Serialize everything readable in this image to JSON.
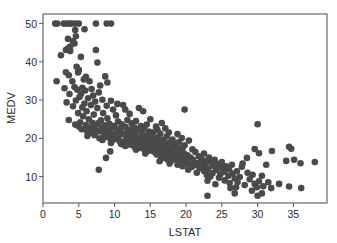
{
  "chart_data": {
    "type": "scatter",
    "title": "",
    "xlabel": "LSTAT",
    "ylabel": "MEDV",
    "xlim": [
      0,
      39.7
    ],
    "ylim": [
      3.1,
      52.5
    ],
    "xticks": [
      0,
      5,
      10,
      15,
      20,
      25,
      30,
      35
    ],
    "yticks": [
      10,
      20,
      30,
      40,
      50
    ],
    "grid": false,
    "legend": null,
    "marker_color": "#4a4a4a",
    "series": [
      {
        "name": "MEDV vs LSTAT",
        "points": [
          [
            1.7,
            50
          ],
          [
            2.0,
            50
          ],
          [
            2.9,
            50
          ],
          [
            3.3,
            50
          ],
          [
            3.7,
            50
          ],
          [
            4.0,
            50
          ],
          [
            4.5,
            50
          ],
          [
            5.0,
            50
          ],
          [
            7.4,
            50
          ],
          [
            8.9,
            50
          ],
          [
            9.5,
            50
          ],
          [
            5.8,
            48.5
          ],
          [
            4.5,
            48.3
          ],
          [
            4.6,
            46.7
          ],
          [
            3.5,
            46
          ],
          [
            4.2,
            45.4
          ],
          [
            4.4,
            44.8
          ],
          [
            3.8,
            44
          ],
          [
            3.5,
            43.5
          ],
          [
            3.2,
            43.1
          ],
          [
            7.4,
            43.1
          ],
          [
            3.8,
            42.8
          ],
          [
            2.5,
            41.7
          ],
          [
            5.3,
            41.3
          ],
          [
            7.6,
            39.8
          ],
          [
            4.7,
            38.7
          ],
          [
            5.0,
            37.9
          ],
          [
            4.9,
            37.2
          ],
          [
            3.2,
            37.3
          ],
          [
            3.6,
            36.5
          ],
          [
            8.7,
            36.2
          ],
          [
            6.0,
            36.1
          ],
          [
            5.7,
            35.4
          ],
          [
            1.9,
            34.9
          ],
          [
            4.1,
            34.9
          ],
          [
            9.0,
            34.6
          ],
          [
            6.5,
            34.9
          ],
          [
            8.0,
            33.8
          ],
          [
            4.4,
            33.4
          ],
          [
            5.5,
            33.2
          ],
          [
            3.0,
            33.1
          ],
          [
            6.8,
            32.9
          ],
          [
            4.8,
            32.7
          ],
          [
            5.9,
            32.5
          ],
          [
            7.8,
            32.0
          ],
          [
            3.7,
            31.6
          ],
          [
            5.3,
            31.5
          ],
          [
            7.0,
            31.2
          ],
          [
            5.1,
            30.8
          ],
          [
            6.3,
            30.5
          ],
          [
            8.3,
            30.1
          ],
          [
            4.6,
            29.9
          ],
          [
            9.5,
            29.8
          ],
          [
            7.3,
            29.6
          ],
          [
            3.3,
            29.4
          ],
          [
            5.8,
            29.1
          ],
          [
            10.4,
            29.0
          ],
          [
            6.7,
            28.7
          ],
          [
            8.9,
            28.5
          ],
          [
            4.2,
            28.4
          ],
          [
            11.2,
            28.7
          ],
          [
            5.5,
            28.1
          ],
          [
            7.6,
            27.9
          ],
          [
            13.4,
            27.9
          ],
          [
            9.8,
            27.5
          ],
          [
            6.1,
            27.1
          ],
          [
            11.5,
            27.5
          ],
          [
            4.9,
            26.6
          ],
          [
            8.4,
            26.6
          ],
          [
            14.0,
            27.1
          ],
          [
            19.8,
            27.5
          ],
          [
            12.1,
            26.4
          ],
          [
            7.1,
            26.2
          ],
          [
            10.2,
            26.0
          ],
          [
            5.6,
            25.8
          ],
          [
            3.6,
            24.8
          ],
          [
            9.0,
            25.2
          ],
          [
            6.4,
            25.0
          ],
          [
            11.8,
            24.8
          ],
          [
            15.0,
            25.0
          ],
          [
            8.1,
            24.7
          ],
          [
            13.0,
            24.5
          ],
          [
            10.5,
            24.4
          ],
          [
            5.2,
            24.2
          ],
          [
            6.9,
            24.1
          ],
          [
            16.6,
            24.0
          ],
          [
            7.7,
            23.9
          ],
          [
            9.3,
            23.8
          ],
          [
            12.4,
            23.9
          ],
          [
            4.5,
            23.6
          ],
          [
            11.0,
            23.7
          ],
          [
            14.5,
            23.6
          ],
          [
            6.0,
            23.5
          ],
          [
            8.6,
            23.4
          ],
          [
            10.0,
            23.3
          ],
          [
            13.7,
            23.2
          ],
          [
            5.0,
            23.1
          ],
          [
            7.3,
            23.1
          ],
          [
            15.8,
            23.1
          ],
          [
            11.5,
            23.0
          ],
          [
            9.6,
            22.9
          ],
          [
            12.8,
            22.8
          ],
          [
            6.5,
            22.7
          ],
          [
            8.2,
            22.6
          ],
          [
            14.1,
            22.6
          ],
          [
            17.1,
            22.6
          ],
          [
            10.8,
            22.5
          ],
          [
            5.4,
            22.4
          ],
          [
            7.0,
            22.3
          ],
          [
            12.2,
            22.3
          ],
          [
            9.0,
            22.2
          ],
          [
            16.0,
            22.2
          ],
          [
            13.3,
            22.1
          ],
          [
            6.1,
            22.0
          ],
          [
            10.3,
            22.0
          ],
          [
            8.0,
            21.9
          ],
          [
            11.8,
            21.8
          ],
          [
            14.8,
            21.8
          ],
          [
            7.5,
            21.7
          ],
          [
            15.4,
            21.6
          ],
          [
            9.4,
            21.6
          ],
          [
            12.5,
            21.5
          ],
          [
            17.6,
            21.5
          ],
          [
            6.8,
            21.4
          ],
          [
            10.9,
            21.4
          ],
          [
            13.9,
            21.3
          ],
          [
            8.5,
            21.2
          ],
          [
            16.4,
            21.2
          ],
          [
            11.3,
            21.1
          ],
          [
            18.8,
            21.1
          ],
          [
            9.8,
            21.0
          ],
          [
            12.9,
            20.9
          ],
          [
            7.2,
            20.8
          ],
          [
            15.1,
            20.8
          ],
          [
            10.6,
            20.7
          ],
          [
            14.4,
            20.6
          ],
          [
            6.2,
            20.6
          ],
          [
            8.8,
            20.5
          ],
          [
            17.3,
            20.5
          ],
          [
            11.9,
            20.4
          ],
          [
            13.5,
            20.3
          ],
          [
            16.0,
            20.3
          ],
          [
            9.2,
            20.2
          ],
          [
            19.4,
            20.1
          ],
          [
            12.3,
            20.1
          ],
          [
            7.9,
            20.0
          ],
          [
            14.0,
            20.0
          ],
          [
            10.1,
            19.9
          ],
          [
            15.7,
            19.9
          ],
          [
            11.6,
            19.8
          ],
          [
            18.1,
            19.7
          ],
          [
            13.1,
            19.7
          ],
          [
            8.3,
            19.6
          ],
          [
            16.8,
            19.6
          ],
          [
            9.7,
            19.5
          ],
          [
            14.6,
            19.5
          ],
          [
            12.0,
            19.4
          ],
          [
            20.4,
            19.4
          ],
          [
            10.7,
            19.3
          ],
          [
            15.3,
            19.3
          ],
          [
            13.7,
            19.2
          ],
          [
            17.9,
            19.1
          ],
          [
            11.2,
            19.1
          ],
          [
            19.0,
            19.0
          ],
          [
            14.2,
            19.0
          ],
          [
            16.3,
            18.9
          ],
          [
            12.6,
            18.9
          ],
          [
            9.5,
            18.8
          ],
          [
            15.0,
            18.7
          ],
          [
            17.4,
            18.7
          ],
          [
            13.3,
            18.6
          ],
          [
            18.6,
            18.5
          ],
          [
            10.9,
            18.5
          ],
          [
            14.8,
            18.4
          ],
          [
            16.1,
            18.3
          ],
          [
            12.2,
            18.3
          ],
          [
            19.8,
            18.2
          ],
          [
            13.9,
            18.2
          ],
          [
            15.6,
            18.1
          ],
          [
            17.0,
            18.0
          ],
          [
            11.5,
            18.0
          ],
          [
            14.4,
            17.9
          ],
          [
            18.3,
            17.8
          ],
          [
            16.6,
            17.8
          ],
          [
            12.8,
            17.7
          ],
          [
            15.2,
            17.6
          ],
          [
            19.5,
            17.5
          ],
          [
            13.6,
            17.5
          ],
          [
            17.7,
            17.4
          ],
          [
            16.0,
            17.3
          ],
          [
            14.1,
            17.2
          ],
          [
            18.9,
            17.2
          ],
          [
            15.8,
            17.1
          ],
          [
            20.9,
            17.1
          ],
          [
            13.0,
            17.0
          ],
          [
            17.2,
            16.9
          ],
          [
            16.4,
            16.8
          ],
          [
            19.2,
            16.7
          ],
          [
            14.7,
            16.7
          ],
          [
            18.0,
            16.6
          ],
          [
            15.5,
            16.5
          ],
          [
            21.3,
            16.4
          ],
          [
            17.5,
            16.3
          ],
          [
            16.9,
            16.2
          ],
          [
            19.7,
            16.1
          ],
          [
            14.3,
            16.0
          ],
          [
            18.5,
            15.9
          ],
          [
            9.4,
            16.6
          ],
          [
            22.5,
            16.0
          ],
          [
            15.9,
            15.8
          ],
          [
            17.8,
            15.7
          ],
          [
            20.2,
            15.6
          ],
          [
            16.4,
            15.5
          ],
          [
            19.1,
            15.4
          ],
          [
            21.8,
            15.3
          ],
          [
            18.2,
            15.2
          ],
          [
            8.8,
            14.9
          ],
          [
            17.1,
            15.1
          ],
          [
            20.6,
            15.0
          ],
          [
            23.2,
            15.0
          ],
          [
            16.7,
            14.9
          ],
          [
            19.6,
            14.8
          ],
          [
            22.1,
            14.7
          ],
          [
            18.6,
            14.6
          ],
          [
            17.4,
            14.5
          ],
          [
            21.0,
            14.4
          ],
          [
            24.0,
            14.4
          ],
          [
            19.9,
            14.3
          ],
          [
            18.0,
            14.2
          ],
          [
            22.8,
            14.1
          ],
          [
            16.3,
            14.0
          ],
          [
            20.5,
            13.9
          ],
          [
            25.0,
            13.8
          ],
          [
            19.3,
            13.8
          ],
          [
            23.5,
            13.6
          ],
          [
            21.6,
            13.5
          ],
          [
            17.7,
            13.4
          ],
          [
            20.0,
            13.3
          ],
          [
            24.4,
            13.3
          ],
          [
            22.3,
            13.2
          ],
          [
            18.8,
            13.1
          ],
          [
            26.4,
            13.1
          ],
          [
            21.2,
            13.0
          ],
          [
            23.8,
            12.8
          ],
          [
            19.5,
            12.7
          ],
          [
            25.6,
            12.7
          ],
          [
            22.7,
            12.6
          ],
          [
            20.8,
            12.5
          ],
          [
            24.9,
            12.3
          ],
          [
            27.8,
            12.6
          ],
          [
            21.9,
            12.2
          ],
          [
            23.1,
            12.0
          ],
          [
            26.0,
            11.9
          ],
          [
            20.3,
            11.8
          ],
          [
            7.8,
            11.8
          ],
          [
            24.2,
            11.7
          ],
          [
            22.5,
            11.5
          ],
          [
            27.1,
            11.4
          ],
          [
            25.3,
            11.3
          ],
          [
            21.5,
            11.0
          ],
          [
            23.7,
            10.9
          ],
          [
            28.6,
            11.0
          ],
          [
            26.5,
            10.8
          ],
          [
            24.8,
            10.6
          ],
          [
            22.9,
            10.4
          ],
          [
            29.3,
            10.5
          ],
          [
            25.9,
            10.2
          ],
          [
            23.4,
            10.0
          ],
          [
            27.5,
            9.9
          ],
          [
            30.6,
            10.2
          ],
          [
            24.6,
            9.7
          ],
          [
            26.8,
            9.5
          ],
          [
            28.9,
            9.3
          ],
          [
            25.4,
            9.0
          ],
          [
            23.0,
            8.9
          ],
          [
            30.2,
            8.8
          ],
          [
            27.2,
            8.6
          ],
          [
            31.5,
            8.5
          ],
          [
            26.1,
            8.3
          ],
          [
            29.6,
            8.1
          ],
          [
            24.1,
            8.0
          ],
          [
            28.2,
            7.8
          ],
          [
            33.0,
            8.1
          ],
          [
            30.8,
            7.5
          ],
          [
            27.0,
            7.2
          ],
          [
            29.9,
            7.2
          ],
          [
            34.4,
            7.4
          ],
          [
            26.2,
            7.0
          ],
          [
            31.9,
            7.0
          ],
          [
            29.2,
            6.3
          ],
          [
            36.1,
            7.0
          ],
          [
            30.6,
            5.6
          ],
          [
            23.0,
            5.0
          ],
          [
            26.8,
            5.6
          ],
          [
            30.0,
            5.0
          ],
          [
            34.0,
            14.1
          ],
          [
            36.0,
            13.5
          ],
          [
            34.4,
            17.8
          ],
          [
            34.7,
            17.3
          ],
          [
            38.0,
            13.8
          ],
          [
            35.1,
            14.4
          ],
          [
            30.0,
            23.7
          ],
          [
            29.6,
            17.2
          ],
          [
            30.2,
            16.1
          ],
          [
            32.0,
            16.7
          ],
          [
            31.2,
            13.1
          ],
          [
            27.9,
            13.4
          ],
          [
            28.5,
            14.9
          ]
        ]
      }
    ]
  },
  "axes": {
    "x_title": "LSTAT",
    "y_title": "MEDV",
    "x_tick_labels": [
      "0",
      "5",
      "10",
      "15",
      "20",
      "25",
      "30",
      "35"
    ],
    "y_tick_labels": [
      "10",
      "20",
      "30",
      "40",
      "50"
    ]
  }
}
